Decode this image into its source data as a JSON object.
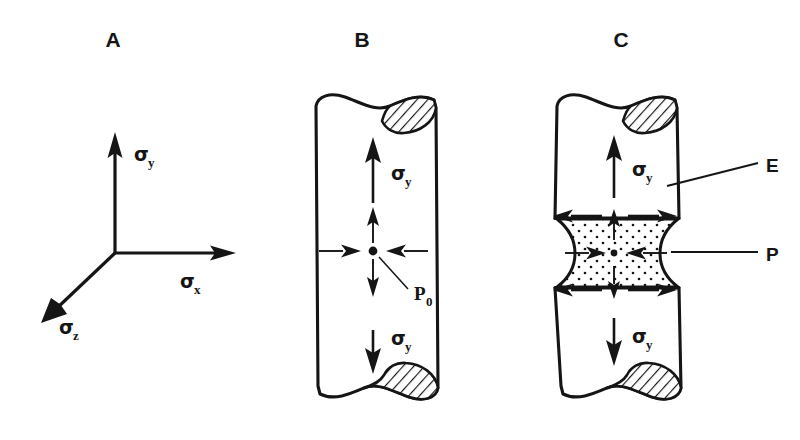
{
  "figure": {
    "background_color": "#ffffff",
    "ink_color": "#151515",
    "width": 800,
    "height": 440
  },
  "panels": [
    {
      "id": "A",
      "letter": "A",
      "description": "Triaxial stress coordinate axes",
      "axes": [
        {
          "name": "sigma-y-axis",
          "symbol": "σ",
          "subscript": "y",
          "direction": "up"
        },
        {
          "name": "sigma-x-axis",
          "symbol": "σ",
          "subscript": "x",
          "direction": "right"
        },
        {
          "name": "sigma-z-axis",
          "symbol": "σ",
          "subscript": "z",
          "direction": "down-left"
        }
      ]
    },
    {
      "id": "B",
      "letter": "B",
      "description": "Uniform cylindrical bar under uniaxial tension",
      "labels": [
        {
          "name": "sigma-y-top",
          "symbol": "σ",
          "subscript": "y"
        },
        {
          "name": "sigma-y-bottom",
          "symbol": "σ",
          "subscript": "y"
        },
        {
          "name": "pressure-label",
          "symbol": "P",
          "subscript": "0"
        }
      ]
    },
    {
      "id": "C",
      "letter": "C",
      "description": "Necked bar showing elastic and plastic zones",
      "labels": [
        {
          "name": "sigma-y-top",
          "symbol": "σ",
          "subscript": "y"
        },
        {
          "name": "sigma-y-bottom",
          "symbol": "σ",
          "subscript": "y"
        },
        {
          "name": "elastic-region-label",
          "symbol": "E",
          "subscript": ""
        },
        {
          "name": "plastic-region-label",
          "symbol": "P",
          "subscript": ""
        }
      ]
    }
  ],
  "text": {
    "panel_a_letter": "A",
    "panel_b_letter": "B",
    "panel_c_letter": "C",
    "sigma": "σ",
    "sub_y": "y",
    "sub_x": "x",
    "sub_z": "z",
    "p_zero_symbol": "P",
    "p_zero_sub": "0",
    "elastic_label": "E",
    "plastic_label": "P"
  }
}
